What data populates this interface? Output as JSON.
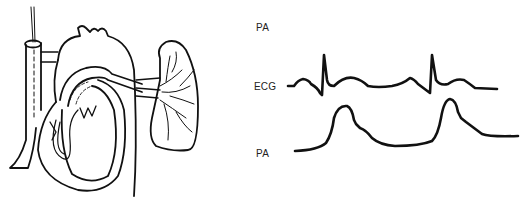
{
  "figure": {
    "labels": {
      "top_label": "PA",
      "ecg_label": "ECG",
      "pa_label": "PA"
    },
    "illustration": "heart-with-pulmonary-artery-catheter",
    "colors": {
      "ink": "#111111",
      "background": "#ffffff"
    }
  }
}
